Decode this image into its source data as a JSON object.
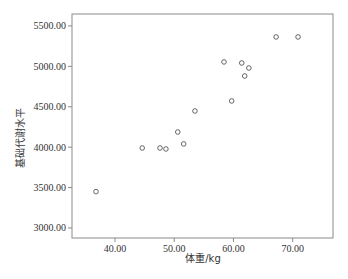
{
  "chart_data": {
    "type": "scatter",
    "title": "",
    "xlabel": "体重/kg",
    "ylabel": "基础代谢水平",
    "xlim": [
      32.75,
      76.8
    ],
    "ylim": [
      2876,
      5648
    ],
    "xticks": [
      40,
      50,
      60,
      70
    ],
    "xtick_labels": [
      "40.00",
      "50.00",
      "60.00",
      "70.00"
    ],
    "yticks": [
      3000,
      3500,
      4000,
      4500,
      5000,
      5500
    ],
    "ytick_labels": [
      "3000.00",
      "3500.00",
      "4000.00",
      "4500.00",
      "5000.00",
      "5500.00"
    ],
    "grid": false,
    "legend": null,
    "marker": "open-circle",
    "series": [
      {
        "name": "体重 vs 基础代谢水平",
        "points": [
          {
            "x": 36.8,
            "y": 3450
          },
          {
            "x": 44.6,
            "y": 3990
          },
          {
            "x": 47.6,
            "y": 3990
          },
          {
            "x": 48.6,
            "y": 3978
          },
          {
            "x": 50.6,
            "y": 4188
          },
          {
            "x": 51.6,
            "y": 4040
          },
          {
            "x": 53.5,
            "y": 4448
          },
          {
            "x": 58.4,
            "y": 5055
          },
          {
            "x": 59.7,
            "y": 4572
          },
          {
            "x": 61.4,
            "y": 5042
          },
          {
            "x": 61.9,
            "y": 4881
          },
          {
            "x": 62.6,
            "y": 4980
          },
          {
            "x": 67.2,
            "y": 5364
          },
          {
            "x": 70.9,
            "y": 5364
          }
        ]
      }
    ]
  },
  "colors": {
    "axis": "#8a8a8a",
    "marker": "#555555",
    "text": "#333333"
  }
}
